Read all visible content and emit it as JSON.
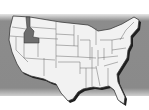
{
  "map": {
    "title": "United States",
    "highlighted_state": "Idaho",
    "colors": {
      "background": "#ffffff",
      "band": "#8a8a8a",
      "state_fill": "#f2f2f2",
      "highlight_fill": "#6e6e6e",
      "border": "#3a3a3a",
      "shadow": "#1e1e1e"
    }
  }
}
